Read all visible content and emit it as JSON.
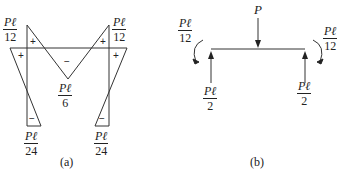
{
  "figure_a": {
    "caption": "(a)",
    "labels": {
      "top_left": {
        "num": "Pℓ",
        "den": "12"
      },
      "top_right": {
        "num": "Pℓ",
        "den": "12"
      },
      "middle": {
        "num": "Pℓ",
        "den": "6"
      },
      "bottom_left": {
        "num": "Pℓ",
        "den": "24"
      },
      "bottom_right": {
        "num": "Pℓ",
        "den": "24"
      }
    },
    "signs": {
      "plus": "+",
      "minus": "−"
    }
  },
  "figure_b": {
    "caption": "(b)",
    "load": "P",
    "moments": {
      "left": {
        "num": "Pℓ",
        "den": "12"
      },
      "right": {
        "num": "Pℓ",
        "den": "12"
      }
    },
    "reactions": {
      "left": {
        "num": "Pℓ",
        "den": "2"
      },
      "right": {
        "num": "Pℓ",
        "den": "2"
      }
    }
  }
}
